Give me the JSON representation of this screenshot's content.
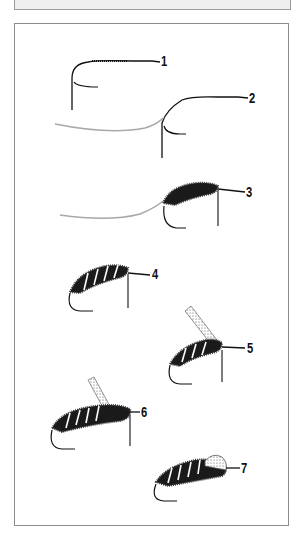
{
  "figure": {
    "type": "fly-tying step diagram",
    "steps": [
      {
        "label": "1",
        "description": "bare hook with thread wrapped along shank"
      },
      {
        "label": "2",
        "description": "ribbing wire tied in at bend"
      },
      {
        "label": "3",
        "description": "dubbed body wound along shank"
      },
      {
        "label": "4",
        "description": "ribbing wire wound forward over body"
      },
      {
        "label": "5",
        "description": "wing-case / shellback strip tied in at front"
      },
      {
        "label": "6",
        "description": "thorax dubbing added behind strip"
      },
      {
        "label": "7",
        "description": "strip folded over thorax, fly finished"
      }
    ]
  },
  "colors": {
    "line": "#111111",
    "wire": "#a8a8a8",
    "frame": "#8c8c8c",
    "topbar": "#efefef"
  }
}
